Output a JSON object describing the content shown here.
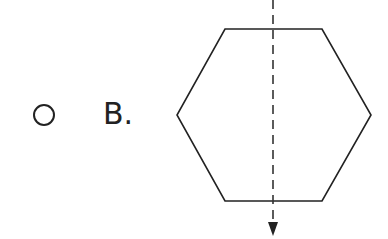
{
  "option": {
    "label": "B.",
    "selected": false,
    "figure": {
      "shape": "regular-hexagon",
      "axis": "vertical-dashed-line-of-symmetry-with-arrow",
      "stroke_color": "#222222",
      "vertices": [
        [
          225,
          29
        ],
        [
          322,
          29
        ],
        [
          371,
          115
        ],
        [
          322,
          201
        ],
        [
          225,
          201
        ],
        [
          177,
          115
        ]
      ],
      "axis_x": 273,
      "axis_y_start": 0,
      "axis_y_end": 236
    }
  }
}
